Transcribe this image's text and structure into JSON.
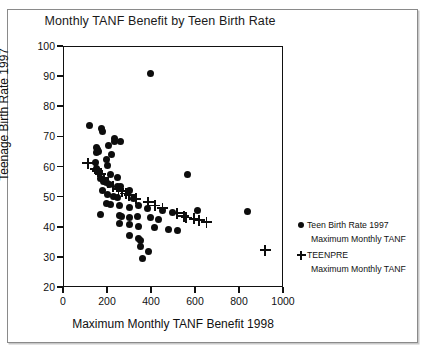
{
  "chart_data": {
    "type": "scatter",
    "title": "Monthly TANF Benefit by Teen Birth Rate",
    "xlabel": "Maximum Monthly TANF Benefit 1998",
    "ylabel": "Teenage Birth Rate 1997",
    "xlim": [
      0,
      1000
    ],
    "ylim": [
      20,
      100
    ],
    "xticks": [
      0,
      200,
      400,
      600,
      800,
      1000
    ],
    "yticks": [
      20,
      30,
      40,
      50,
      60,
      70,
      80,
      90,
      100
    ],
    "grid": false,
    "legend_position": "right",
    "series": [
      {
        "name": "Teen Birth Rate 1997",
        "sub": "Maximum Monthly TANF",
        "marker": "circle",
        "color": "#0d0d0d",
        "points": [
          [
            398,
            91.0
          ],
          [
            120,
            73.6
          ],
          [
            175,
            72.6
          ],
          [
            180,
            71.6
          ],
          [
            232,
            69.3
          ],
          [
            236,
            68.2
          ],
          [
            263,
            68.4
          ],
          [
            150,
            66.2
          ],
          [
            157,
            65.8
          ],
          [
            152,
            64.6
          ],
          [
            160,
            64.9
          ],
          [
            208,
            66.9
          ],
          [
            222,
            64.1
          ],
          [
            148,
            61.4
          ],
          [
            197,
            62.2
          ],
          [
            200,
            60.2
          ],
          [
            152,
            59.2
          ],
          [
            156,
            58.6
          ],
          [
            167,
            58.0
          ],
          [
            214,
            57.4
          ],
          [
            247,
            56.3
          ],
          [
            565,
            57.2
          ],
          [
            171,
            55.9
          ],
          [
            184,
            55.1
          ],
          [
            196,
            54.6
          ],
          [
            210,
            54.0
          ],
          [
            246,
            53.4
          ],
          [
            262,
            53.2
          ],
          [
            300,
            52.1
          ],
          [
            178,
            51.9
          ],
          [
            200,
            50.6
          ],
          [
            230,
            50.2
          ],
          [
            246,
            49.6
          ],
          [
            320,
            49.4
          ],
          [
            196,
            47.8
          ],
          [
            214,
            47.4
          ],
          [
            257,
            47.1
          ],
          [
            300,
            46.5
          ],
          [
            345,
            47.2
          ],
          [
            386,
            46.2
          ],
          [
            450,
            45.4
          ],
          [
            498,
            44.8
          ],
          [
            612,
            45.4
          ],
          [
            840,
            45.0
          ],
          [
            171,
            44.2
          ],
          [
            255,
            43.6
          ],
          [
            268,
            43.4
          ],
          [
            300,
            43.0
          ],
          [
            340,
            43.4
          ],
          [
            397,
            43.1
          ],
          [
            432,
            42.4
          ],
          [
            255,
            41.0
          ],
          [
            300,
            40.6
          ],
          [
            341,
            40.0
          ],
          [
            415,
            39.6
          ],
          [
            480,
            39.2
          ],
          [
            520,
            38.8
          ],
          [
            300,
            37.2
          ],
          [
            345,
            36.1
          ],
          [
            352,
            35.4
          ],
          [
            352,
            33.6
          ],
          [
            390,
            31.9
          ],
          [
            360,
            29.6
          ]
        ]
      },
      {
        "name": "TEENPRE",
        "sub": "Maximum Monthly TANF",
        "marker": "plus",
        "color": "#0d0d0d",
        "points": [
          [
            112,
            61.0
          ],
          [
            146,
            59.2
          ],
          [
            158,
            58.5
          ],
          [
            171,
            57.6
          ],
          [
            185,
            56.0
          ],
          [
            204,
            54.6
          ],
          [
            228,
            53.3
          ],
          [
            252,
            52.4
          ],
          [
            266,
            51.8
          ],
          [
            286,
            51.0
          ],
          [
            300,
            50.4
          ],
          [
            330,
            49.3
          ],
          [
            388,
            48.1
          ],
          [
            418,
            47.0
          ],
          [
            452,
            46.1
          ],
          [
            520,
            44.4
          ],
          [
            548,
            43.4
          ],
          [
            560,
            43.0
          ],
          [
            596,
            42.6
          ],
          [
            620,
            42.2
          ],
          [
            652,
            41.5
          ],
          [
            920,
            32.2
          ]
        ]
      }
    ]
  }
}
